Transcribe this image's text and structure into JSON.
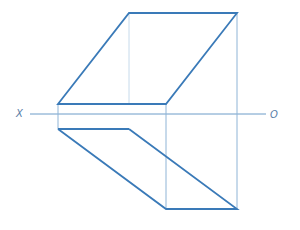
{
  "diagram": {
    "type": "orthographic-projection",
    "colors": {
      "edge": "#3a7ab8",
      "projector": "#8fb4d6",
      "axis": "#6c9cc8",
      "label": "#5a7ea8"
    },
    "axis": {
      "left_label": "X",
      "right_label": "O",
      "y": 114,
      "x1": 30,
      "x2": 266
    },
    "top_view": {
      "outline": [
        [
          58,
          104
        ],
        [
          129,
          13
        ],
        [
          237,
          13
        ],
        [
          166,
          104
        ]
      ]
    },
    "front_view": {
      "rect": [
        [
          58,
          104
        ],
        [
          166,
          104
        ],
        [
          166,
          129
        ],
        [
          58,
          129
        ]
      ],
      "outline": [
        [
          58,
          129
        ],
        [
          129,
          129
        ],
        [
          237,
          209
        ],
        [
          166,
          209
        ]
      ]
    },
    "projectors": [
      [
        [
          129,
          13
        ],
        [
          129,
          104
        ]
      ],
      [
        [
          237,
          13
        ],
        [
          237,
          209
        ]
      ],
      [
        [
          166,
          104
        ],
        [
          166,
          209
        ]
      ]
    ]
  }
}
